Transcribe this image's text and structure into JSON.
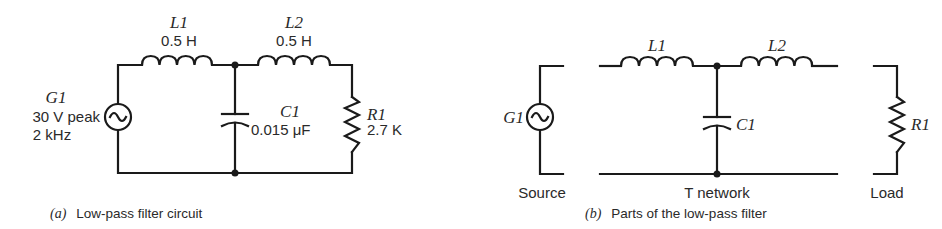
{
  "figure_a": {
    "caption_tag": "(a)",
    "caption": "Low-pass filter circuit",
    "source": {
      "ref": "G1",
      "amplitude": "30 V peak",
      "frequency": "2 kHz",
      "icon": "ac-source-icon"
    },
    "inductor1": {
      "ref": "L1",
      "value": "0.5 H"
    },
    "inductor2": {
      "ref": "L2",
      "value": "0.5 H"
    },
    "capacitor": {
      "ref": "C1",
      "value": "0.015 μF"
    },
    "resistor": {
      "ref": "R1",
      "value": "2.7 K"
    }
  },
  "figure_b": {
    "caption_tag": "(b)",
    "caption": "Parts of the low-pass filter",
    "source": {
      "ref": "G1",
      "label": "Source"
    },
    "network": {
      "label": "T network",
      "inductor1": "L1",
      "inductor2": "L2",
      "capacitor": "C1"
    },
    "load": {
      "ref": "R1",
      "label": "Load"
    }
  },
  "colors": {
    "ink": "#1a1a1a",
    "background": "#ffffff"
  }
}
